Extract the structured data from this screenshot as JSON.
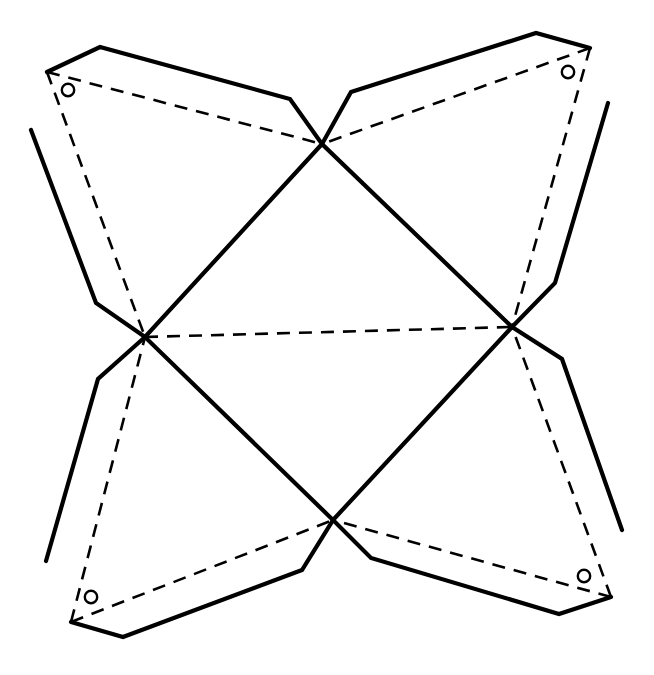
{
  "figure": {
    "background_color": "#ffffff",
    "line_color": "#000000",
    "canvas": {
      "width": 654,
      "height": 675
    }
  },
  "style": {
    "solid_stroke_width": 4.2,
    "fold_stroke_width": 2.6,
    "fold_dash_pattern": "13 9",
    "hole_stroke_width": 2.4,
    "hole_radius": 6.2
  },
  "nodes": {
    "top": {
      "name": "top-junction",
      "x": 322,
      "y": 144
    },
    "left": {
      "name": "left-junction",
      "x": 145,
      "y": 337
    },
    "right": {
      "name": "right-junction",
      "x": 512,
      "y": 327
    },
    "bottom": {
      "name": "bottom-junction",
      "x": 333,
      "y": 520
    },
    "corner_tl": {
      "name": "corner-top-left",
      "x": 47,
      "y": 72
    },
    "corner_tr": {
      "name": "corner-top-right",
      "x": 590,
      "y": 48
    },
    "corner_bl": {
      "name": "corner-bottom-left",
      "x": 71,
      "y": 622
    },
    "corner_br": {
      "name": "corner-bottom-right",
      "x": 611,
      "y": 597
    }
  },
  "wings": [
    {
      "id": "wing-top-left",
      "label": "Top left flap",
      "outline": "47,72 100,47 290,99 322,144 145,337 96,303 31,130"
    },
    {
      "id": "wing-top-right",
      "label": "Top right flap",
      "outline": "590,48 536,33 351,92 322,144 512,327 555,283 608,103"
    },
    {
      "id": "wing-bottom-left",
      "label": "Bottom left flap",
      "outline": "71,622 123,637 302,570 333,520 145,337 98,379 46,561"
    },
    {
      "id": "wing-bottom-right",
      "label": "Bottom right flap",
      "outline": "611,597 559,614 371,558 333,520 512,327 562,359 622,530"
    }
  ],
  "fold_lines": [
    {
      "id": "fold-top-left-hinge",
      "label": "Fold top-left to top junction",
      "x1": 47,
      "y1": 72,
      "x2": 322,
      "y2": 144
    },
    {
      "id": "fold-top-left-diagonal",
      "label": "Fold top-left to left junction",
      "x1": 47,
      "y1": 72,
      "x2": 145,
      "y2": 337
    },
    {
      "id": "fold-top-right-hinge",
      "label": "Fold top-right to top junction",
      "x1": 590,
      "y1": 48,
      "x2": 322,
      "y2": 144
    },
    {
      "id": "fold-top-right-diagonal",
      "label": "Fold top-right to right junction",
      "x1": 590,
      "y1": 48,
      "x2": 512,
      "y2": 327
    },
    {
      "id": "fold-bottom-left-hinge",
      "label": "Fold bottom-left to bottom junction",
      "x1": 71,
      "y1": 622,
      "x2": 333,
      "y2": 520
    },
    {
      "id": "fold-bottom-left-diagonal",
      "label": "Fold bottom-left to left junction",
      "x1": 71,
      "y1": 622,
      "x2": 145,
      "y2": 337
    },
    {
      "id": "fold-bottom-right-hinge",
      "label": "Fold bottom-right to bottom junction",
      "x1": 611,
      "y1": 597,
      "x2": 333,
      "y2": 520
    },
    {
      "id": "fold-bottom-right-diagonal",
      "label": "Fold bottom-right to right junction",
      "x1": 611,
      "y1": 597,
      "x2": 512,
      "y2": 327
    },
    {
      "id": "fold-center-top-left",
      "label": "Center fold top to left",
      "x1": 322,
      "y1": 144,
      "x2": 145,
      "y2": 337
    },
    {
      "id": "fold-center-top-right",
      "label": "Center fold top to right",
      "x1": 322,
      "y1": 144,
      "x2": 512,
      "y2": 327
    },
    {
      "id": "fold-center-bottom-left",
      "label": "Center fold bottom to left",
      "x1": 333,
      "y1": 520,
      "x2": 145,
      "y2": 337
    },
    {
      "id": "fold-center-bottom-right",
      "label": "Center fold bottom to right",
      "x1": 333,
      "y1": 520,
      "x2": 512,
      "y2": 327
    },
    {
      "id": "fold-diagonal-tl-br",
      "label": "Long diagonal top-left junction to bottom-right junction",
      "x1": 145,
      "y1": 337,
      "x2": 512,
      "y2": 327
    }
  ],
  "holes": [
    {
      "id": "hole-top-left",
      "label": "Punch hole top left",
      "cx": 68,
      "cy": 90,
      "r": 6.2
    },
    {
      "id": "hole-top-right",
      "label": "Punch hole top right",
      "cx": 568,
      "cy": 72,
      "r": 6.2
    },
    {
      "id": "hole-bottom-left",
      "label": "Punch hole bottom left",
      "cx": 91,
      "cy": 597,
      "r": 6.2
    },
    {
      "id": "hole-bottom-right",
      "label": "Punch hole bottom right",
      "cx": 584,
      "cy": 576,
      "r": 6.2
    }
  ]
}
